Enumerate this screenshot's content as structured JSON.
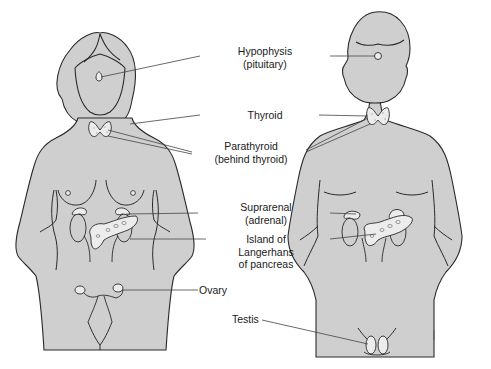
{
  "diagram": {
    "figures": [
      {
        "id": "female",
        "label": "Female figure"
      },
      {
        "id": "male",
        "label": "Male figure"
      }
    ],
    "labels": {
      "hypophysis": {
        "line1": "Hypophysis",
        "line2": "(pituitary)"
      },
      "thyroid": {
        "line1": "Thyroid"
      },
      "parathyroid": {
        "line1": "Parathyroid",
        "line2": "(behind thyroid)"
      },
      "suprarenal": {
        "line1": "Suprarenal",
        "line2": "(adrenal)"
      },
      "islets": {
        "line1": "Island of",
        "line2": "Langerhans",
        "line3": "of pancreas"
      },
      "ovary": {
        "line1": "Ovary"
      },
      "testis": {
        "line1": "Testis"
      }
    },
    "colors": {
      "skin_fill": "#cfcfcf",
      "outline": "#2a2a2a",
      "gland_fill": "#ececec",
      "leader_line": "#444444",
      "background": "#ffffff"
    }
  }
}
